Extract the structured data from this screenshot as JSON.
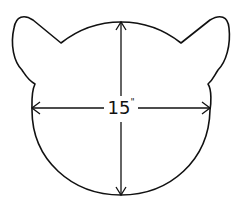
{
  "diagram": {
    "shape": "cat-head-template",
    "measurement": {
      "value": "15",
      "unit_mark": "\"",
      "label": "15\""
    },
    "arrows": [
      "horizontal-width",
      "vertical-height"
    ],
    "colors": {
      "stroke": "#111111",
      "fill": "#ffffff"
    }
  }
}
